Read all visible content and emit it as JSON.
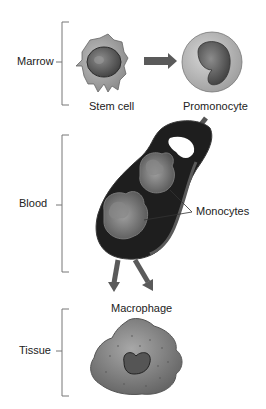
{
  "stages": [
    {
      "label": "Marrow"
    },
    {
      "label": "Blood"
    },
    {
      "label": "Tissue"
    }
  ],
  "cells": {
    "stem_cell": "Stem cell",
    "promonocyte": "Promonocyte",
    "monocytes": "Monocytes",
    "macrophage": "Macrophage"
  },
  "colors": {
    "bracket": "#777777",
    "arrow": "#5a5a5a",
    "vessel": "#1e1e1e",
    "cell_light": "#b8b8b8",
    "cell_dark": "#6e6e6e"
  }
}
